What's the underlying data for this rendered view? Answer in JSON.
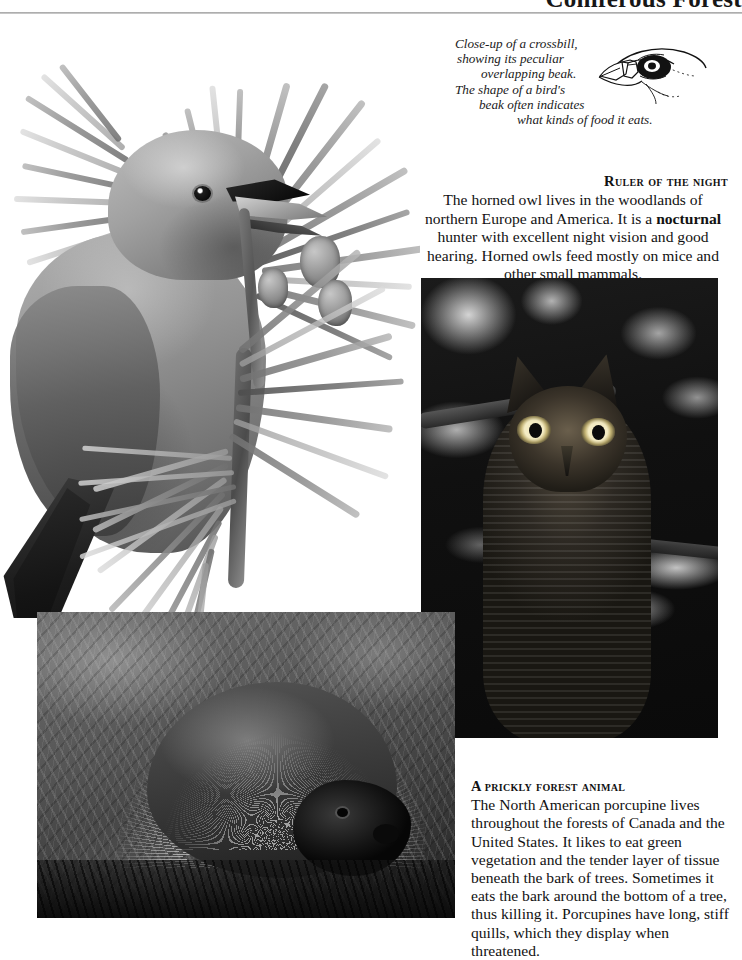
{
  "header": {
    "title": "Coniferous Forest",
    "rule": "header-divider"
  },
  "crossbill_caption": {
    "line1": "Close-up of a crossbill,",
    "line2": "showing its peculiar",
    "line3": "overlapping beak.",
    "line4": "The shape of a bird's",
    "line5": "beak often indicates",
    "line6": "what kinds of food it eats.",
    "full_text": "Close-up of a crossbill, showing its peculiar overlapping beak. The shape of a bird's beak often indicates what kinds of food it eats."
  },
  "figures": {
    "crossbill_photo_alt": "Crossbill perched on a pine branch",
    "beak_drawing_alt": "Line drawing of a crossbill head showing the overlapping beak",
    "owl_photo_alt": "Great horned owl perched on a branch at night",
    "porcupine_photo_alt": "North American porcupine with raised quills in vegetation"
  },
  "owl_block": {
    "heading": "Ruler of the night",
    "text_before_bold": "The horned owl lives in the woodlands of northern Europe and America. It is a ",
    "bold_term": "nocturnal",
    "text_after_bold": " hunter with excellent night vision and good hearing. Horned owls feed mostly on mice and other small mammals.",
    "full_text": "The horned owl lives in the woodlands of northern Europe and America. It is a nocturnal hunter with excellent night vision and good hearing. Horned owls feed mostly on mice and other small mammals."
  },
  "porcupine_block": {
    "heading": "A prickly forest animal",
    "body": "The North American porcupine lives throughout the forests of Canada and the United States. It likes to eat green vegetation and the tender layer of tissue beneath the bark of trees. Sometimes it eats the bark around the bottom of a tree, thus killing it. Porcupines have long, stiff quills, which they display when threatened."
  },
  "colors": {
    "page_background": "#ffffff",
    "text": "#121212",
    "rule": "#9d9d9d"
  }
}
